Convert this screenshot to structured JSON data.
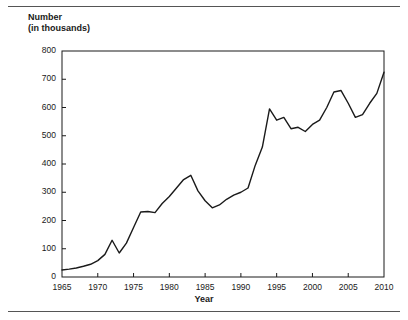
{
  "chart_data": {
    "type": "line",
    "title": "",
    "ylabel": "Number\n(in thousands)",
    "ylabel_line1": "Number",
    "ylabel_line2": "(in thousands)",
    "xlabel": "Year",
    "xlim": [
      1965,
      2010
    ],
    "ylim": [
      0,
      800
    ],
    "y_ticks": [
      0,
      100,
      200,
      300,
      400,
      500,
      600,
      700,
      800
    ],
    "x_ticks": [
      1965,
      1970,
      1975,
      1980,
      1985,
      1990,
      1995,
      2000,
      2005,
      2010
    ],
    "grid": false,
    "legend": "none",
    "line_color": "#1a1a1a",
    "axis_color": "#1a1a1a",
    "x": [
      1965,
      1966,
      1967,
      1968,
      1969,
      1970,
      1971,
      1972,
      1973,
      1974,
      1975,
      1976,
      1977,
      1978,
      1979,
      1980,
      1981,
      1982,
      1983,
      1984,
      1985,
      1986,
      1987,
      1988,
      1989,
      1990,
      1991,
      1992,
      1993,
      1994,
      1995,
      1996,
      1997,
      1998,
      1999,
      2000,
      2001,
      2002,
      2003,
      2004,
      2005,
      2006,
      2007,
      2008,
      2009,
      2010
    ],
    "values": [
      25,
      28,
      32,
      38,
      45,
      58,
      80,
      130,
      85,
      120,
      175,
      230,
      232,
      228,
      260,
      285,
      315,
      345,
      360,
      305,
      270,
      245,
      255,
      275,
      290,
      300,
      315,
      395,
      460,
      595,
      555,
      565,
      525,
      530,
      515,
      540,
      555,
      600,
      655,
      660,
      615,
      565,
      575,
      615,
      650,
      725
    ]
  }
}
